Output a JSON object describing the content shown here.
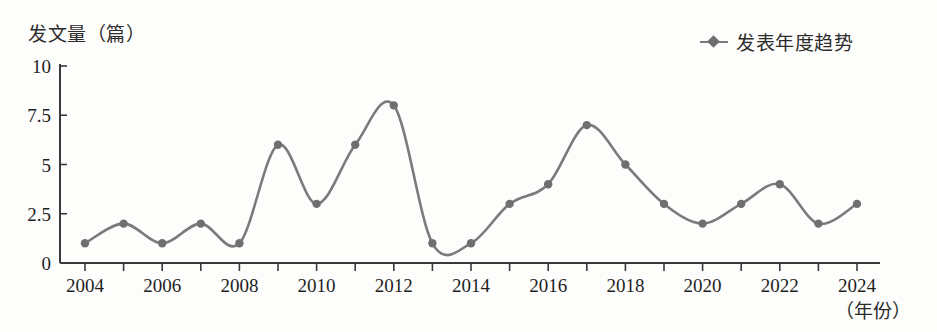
{
  "chart_data": {
    "type": "line",
    "title": "",
    "subtitle": "",
    "ylabel": "发文量（篇）",
    "xlabel": "（年份）",
    "legend": [
      {
        "name": "发表年度趋势",
        "marker": "diamond-marker-icon",
        "color": "#6f6f6f"
      }
    ],
    "legend_position": "top-right",
    "grid": false,
    "line_color": "#7b7b7b",
    "marker_color": "#6f6f6f",
    "axis_color": "#3a3a3a",
    "x": [
      2004,
      2005,
      2006,
      2007,
      2008,
      2009,
      2010,
      2011,
      2012,
      2013,
      2014,
      2015,
      2016,
      2017,
      2018,
      2019,
      2020,
      2021,
      2022,
      2023,
      2024
    ],
    "categories": [
      "2004",
      "2005",
      "2006",
      "2007",
      "2008",
      "2009",
      "2010",
      "2011",
      "2012",
      "2013",
      "2014",
      "2015",
      "2016",
      "2017",
      "2018",
      "2019",
      "2020",
      "2021",
      "2022",
      "2023",
      "2024"
    ],
    "values": [
      1,
      2,
      1,
      2,
      1,
      6,
      3,
      6,
      8,
      1,
      1,
      3,
      4,
      7,
      5,
      3,
      2,
      3,
      4,
      2,
      3
    ],
    "series": [
      {
        "name": "发表年度趋势",
        "values": [
          1,
          2,
          1,
          2,
          1,
          6,
          3,
          6,
          8,
          1,
          1,
          3,
          4,
          7,
          5,
          3,
          2,
          3,
          4,
          2,
          3
        ]
      }
    ],
    "xlim": [
      2004,
      2024
    ],
    "ylim": [
      0,
      10
    ],
    "ytick_labels": [
      "0",
      "2.5",
      "5",
      "7.5",
      "10"
    ],
    "ytick_values": [
      0,
      2.5,
      5,
      7.5,
      10
    ],
    "xtick_labels": [
      "2004",
      "2006",
      "2008",
      "2010",
      "2012",
      "2014",
      "2016",
      "2018",
      "2020",
      "2022",
      "2024"
    ],
    "xtick_values": [
      2004,
      2006,
      2008,
      2010,
      2012,
      2014,
      2016,
      2018,
      2020,
      2022,
      2024
    ]
  }
}
